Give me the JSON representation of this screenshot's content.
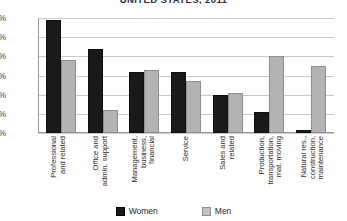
{
  "chart_data": {
    "type": "bar",
    "title": "UNITED STATES, 2011",
    "xlabel": "",
    "ylabel": "",
    "ylim": [
      0,
      30
    ],
    "ytick_labels": [
      "0%",
      "5%",
      "10%",
      "15%",
      "20%",
      "25%",
      "30%"
    ],
    "ytick_values": [
      0,
      5,
      10,
      15,
      20,
      25,
      30
    ],
    "grid": true,
    "legend_position": "bottom",
    "categories": [
      "Professional and related",
      "Office and admin. support",
      "Management, business, financial",
      "Service",
      "Sales and related",
      "Production, transportation, mat. moving",
      "Natural res., construction, maintenance"
    ],
    "category_lines": [
      [
        "Professional",
        "and related"
      ],
      [
        "Office and",
        "admin. support"
      ],
      [
        "Management,",
        "business,",
        "financial"
      ],
      [
        "Service"
      ],
      [
        "Sales and",
        "related"
      ],
      [
        "Production,",
        "transportation,",
        "mat. moving"
      ],
      [
        "Natural res.,",
        "construction,",
        "maintenance"
      ]
    ],
    "series": [
      {
        "name": "Women",
        "color": "#1a1a1a",
        "values": [
          29.5,
          22.0,
          16.0,
          16.0,
          10.0,
          5.5,
          0.7
        ]
      },
      {
        "name": "Men",
        "color": "#b3b3b3",
        "values": [
          19.0,
          6.0,
          16.5,
          13.5,
          10.5,
          20.0,
          17.5
        ]
      }
    ]
  },
  "legend": {
    "items": [
      {
        "label": "Women"
      },
      {
        "label": "Men"
      }
    ]
  },
  "colors": {
    "women": "#1a1a1a",
    "men": "#b3b3b3",
    "grid": "#c9c9c9",
    "axis": "#9a9a9a",
    "background": "#ffffff",
    "title": "#2b2b3a"
  }
}
